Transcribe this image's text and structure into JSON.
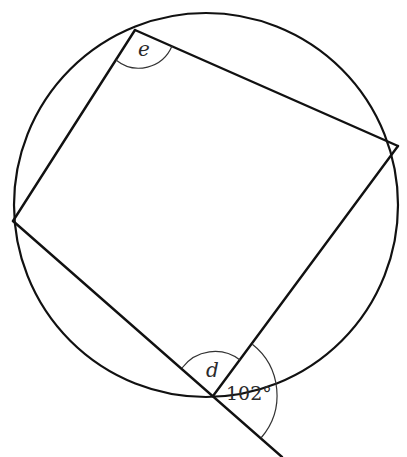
{
  "diagram": {
    "type": "cyclic-quadrilateral",
    "stroke_color": "#111111",
    "circle": {
      "cx": 206,
      "cy": 205,
      "r": 193
    },
    "vertices": {
      "top": [
        135,
        30
      ],
      "right": [
        398,
        146
      ],
      "bottom": [
        213,
        396
      ],
      "left": [
        13,
        221
      ]
    },
    "extension_end": [
      282,
      457
    ],
    "labels": {
      "angle_e": "e",
      "angle_d": "d",
      "exterior_angle": "102°"
    }
  }
}
